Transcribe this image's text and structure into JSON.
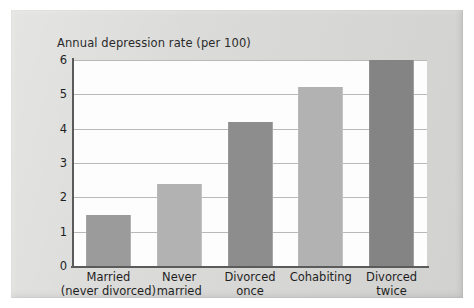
{
  "chart_data": {
    "type": "bar",
    "title": "Annual depression rate (per 100)",
    "xlabel": "",
    "ylabel": "",
    "ylim": [
      0,
      6
    ],
    "yticks": [
      "0",
      "1",
      "2",
      "3",
      "4",
      "5",
      "6"
    ],
    "grid": true,
    "legend": "none",
    "categories": [
      "Married (never divorced)",
      "Never married",
      "Divorced once",
      "Cohabiting",
      "Divorced twice"
    ],
    "category_lines": [
      [
        "Married",
        "(never divorced)"
      ],
      [
        "Never",
        "married"
      ],
      [
        "Divorced",
        "once"
      ],
      [
        "Cohabiting"
      ],
      [
        "Divorced",
        "twice"
      ]
    ],
    "values": [
      1.5,
      2.4,
      4.2,
      5.2,
      6.0
    ],
    "bar_colors": [
      "#9b9b9b",
      "#b2b2b2",
      "#8d8d8d",
      "#b2b2b2",
      "#848484"
    ]
  },
  "page": {
    "background_color": "#d9d9d7",
    "plot_background_color": "#fdfdfd",
    "axis_color": "#5b5b5b",
    "gridline_color": "#b9b9b9"
  }
}
